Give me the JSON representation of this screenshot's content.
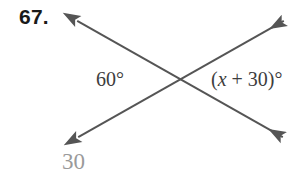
{
  "figure": {
    "problem_number": "67.",
    "background_color": "#ffffff",
    "line_color": "#555555",
    "line_width": 2,
    "intersection": {
      "x": 180,
      "y": 79
    },
    "lines": [
      {
        "name": "line-top-left-to-bottom-right",
        "x1": 72,
        "y1": 18,
        "x2": 288,
        "y2": 140,
        "arrow_start": true,
        "arrow_end": true
      },
      {
        "name": "line-bottom-left-to-top-right",
        "x1": 73,
        "y1": 140,
        "x2": 289,
        "y2": 18,
        "arrow_start": true,
        "arrow_end": true
      }
    ],
    "labels": {
      "left_angle": "60°",
      "right_angle_prefix": "(",
      "right_angle_variable": "x",
      "right_angle_suffix": " + 30)°",
      "right_angle_full": "(x + 30)°"
    },
    "answer": {
      "value": "30",
      "color": "#9a9a9a"
    }
  }
}
